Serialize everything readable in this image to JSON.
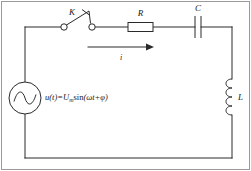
{
  "diagram": {
    "background_color": "#ffffff",
    "wire_color": "#2a2a2a",
    "frame_color": "#9a9a9a"
  },
  "source": {
    "icon": "ac-voltage-source-icon",
    "symbol_description": "circle with sine wave",
    "formula_prefix": "u(t)=U",
    "formula_subscript": "m",
    "formula_suffix_fn": "sin",
    "formula_suffix": "(ωt+φ)",
    "formula_full": "u(t)=Uₘsin(ωt+φ)"
  },
  "components": {
    "switch": {
      "label": "K",
      "icon": "switch-open-icon",
      "state": "open"
    },
    "resistor": {
      "label": "R",
      "icon": "resistor-icon"
    },
    "capacitor": {
      "label": "C",
      "icon": "capacitor-icon"
    },
    "inductor": {
      "label": "L",
      "icon": "inductor-coil-icon"
    }
  },
  "current": {
    "label": "i",
    "icon": "arrow-right-icon",
    "direction": "right"
  }
}
